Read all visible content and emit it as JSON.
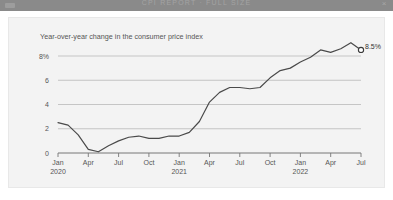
{
  "window": {
    "title": "CPI REPORT · FULL SIZE",
    "left_icon": "window-menu-icon",
    "close_label": "×",
    "bar_color": "#8a8a8a"
  },
  "card": {
    "background": "#f3f3f3",
    "border_color": "#e8e8e8"
  },
  "chart_data": {
    "type": "line",
    "title": "Year-over-year change in the consumer price index",
    "xlabel": "",
    "ylabel": "",
    "ylim": [
      0,
      9.4
    ],
    "yticks": [
      0,
      2,
      4,
      6,
      8
    ],
    "ytick_labels": [
      "0",
      "2",
      "4",
      "6",
      "8%"
    ],
    "grid": "horizontal",
    "legend_position": "none",
    "line_color": "#4a4a4a",
    "marker_color": "#ffffff",
    "marker_edge_color": "#3a3a3a",
    "endpoint_label": "8.5%",
    "endpoint_value": 8.5,
    "xtick_labels": [
      {
        "month": "Jan",
        "year": "2020"
      },
      {
        "month": "Apr",
        "year": ""
      },
      {
        "month": "Jul",
        "year": ""
      },
      {
        "month": "Oct",
        "year": ""
      },
      {
        "month": "Jan",
        "year": "2021"
      },
      {
        "month": "Apr",
        "year": ""
      },
      {
        "month": "Jul",
        "year": ""
      },
      {
        "month": "Oct",
        "year": ""
      },
      {
        "month": "Jan",
        "year": "2022"
      },
      {
        "month": "Apr",
        "year": ""
      },
      {
        "month": "Jul",
        "year": ""
      }
    ],
    "x": [
      "2020-01",
      "2020-02",
      "2020-03",
      "2020-04",
      "2020-05",
      "2020-06",
      "2020-07",
      "2020-08",
      "2020-09",
      "2020-10",
      "2020-11",
      "2020-12",
      "2021-01",
      "2021-02",
      "2021-03",
      "2021-04",
      "2021-05",
      "2021-06",
      "2021-07",
      "2021-08",
      "2021-09",
      "2021-10",
      "2021-11",
      "2021-12",
      "2022-01",
      "2022-02",
      "2022-03",
      "2022-04",
      "2022-05",
      "2022-06",
      "2022-07"
    ],
    "values": [
      2.5,
      2.3,
      1.5,
      0.3,
      0.1,
      0.6,
      1.0,
      1.3,
      1.4,
      1.2,
      1.2,
      1.4,
      1.4,
      1.7,
      2.6,
      4.2,
      5.0,
      5.4,
      5.4,
      5.3,
      5.4,
      6.2,
      6.8,
      7.0,
      7.5,
      7.9,
      8.5,
      8.3,
      8.6,
      9.1,
      8.5
    ]
  }
}
